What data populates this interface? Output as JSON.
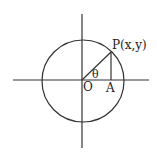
{
  "diagram": {
    "type": "unit-circle",
    "labels": {
      "point": "P(x,y)",
      "angle": "θ",
      "origin": "O",
      "foot": "A"
    },
    "geometry": {
      "center": [
        83,
        80
      ],
      "radius": 41,
      "point_P": [
        111,
        52
      ],
      "point_A": [
        111,
        80
      ]
    },
    "colors": {
      "stroke": "#333333",
      "text": "#222222",
      "background": "#ffffff"
    }
  }
}
